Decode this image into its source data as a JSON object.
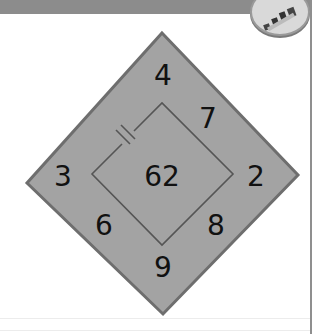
{
  "header": {
    "badge_icon": "blocks-icon",
    "strip_color": "#8c8c8c"
  },
  "diagram": {
    "type": "number-puzzle-diamond",
    "outer_fill": "#a3a3a3",
    "outer_stroke": "#6e6e6e",
    "inner_stroke": "#555555",
    "center_value": "62",
    "outer_vertices": {
      "top": "4",
      "left": "3",
      "right": "2",
      "bottom": "9"
    },
    "edge_values": {
      "upper_right": "7",
      "lower_left": "6",
      "lower_right": "8"
    },
    "inner_edge_marker": "double-tick"
  }
}
